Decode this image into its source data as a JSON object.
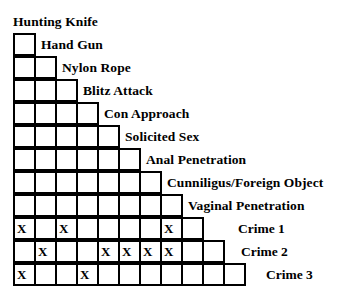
{
  "figure": {
    "type": "staircase-matrix",
    "mark_symbol": "X",
    "colors": {
      "ink": "#000000",
      "paper": "#ffffff",
      "grid_line": "#000000"
    }
  },
  "variables": [
    "Hunting Knife",
    "Hand Gun",
    "Nylon Rope",
    "Blitz Attack",
    "Con Approach",
    "Solicited Sex",
    "Anal Penetration",
    "Cunniligus/Foreign Object",
    "Vaginal Penetration"
  ],
  "rows": [
    {
      "label": "Hunting Knife",
      "cells": 0,
      "marks": []
    },
    {
      "label": "Hand Gun",
      "cells": 1,
      "marks": []
    },
    {
      "label": "Nylon Rope",
      "cells": 2,
      "marks": []
    },
    {
      "label": "Blitz Attack",
      "cells": 3,
      "marks": []
    },
    {
      "label": "Con Approach",
      "cells": 4,
      "marks": []
    },
    {
      "label": "Solicited Sex",
      "cells": 5,
      "marks": []
    },
    {
      "label": "Anal Penetration",
      "cells": 6,
      "marks": []
    },
    {
      "label": "Cunniligus/Foreign Object",
      "cells": 7,
      "marks": []
    },
    {
      "label": "Vaginal Penetration",
      "cells": 8,
      "marks": []
    }
  ],
  "crime_rows": [
    {
      "label": "Crime 1",
      "cells": 9,
      "marks": [
        1,
        3,
        8
      ],
      "label_offset": 36
    },
    {
      "label": "Crime 2",
      "cells": 10,
      "marks": [
        2,
        5,
        6,
        7,
        8
      ],
      "label_offset": 18
    },
    {
      "label": "Crime 3",
      "cells": 11,
      "marks": [
        1,
        4
      ],
      "label_offset": 22
    }
  ],
  "chart_data": {
    "type": "table",
    "title": "",
    "categories": [
      "Hunting Knife",
      "Hand Gun",
      "Nylon Rope",
      "Blitz Attack",
      "Con Approach",
      "Solicited Sex",
      "Anal Penetration",
      "Cunniligus/Foreign Object",
      "Vaginal Penetration",
      "Crime 1",
      "Crime 2"
    ],
    "series": [
      {
        "name": "Crime 1",
        "values": [
          1,
          0,
          1,
          0,
          0,
          0,
          0,
          1,
          0,
          0,
          0
        ]
      },
      {
        "name": "Crime 2",
        "values": [
          0,
          1,
          0,
          0,
          1,
          1,
          1,
          1,
          0,
          0,
          0
        ]
      },
      {
        "name": "Crime 3",
        "values": [
          1,
          0,
          0,
          1,
          0,
          0,
          0,
          0,
          0,
          0,
          0
        ]
      }
    ],
    "xlabel": "",
    "ylabel": "",
    "grid": true,
    "legend": "none"
  }
}
